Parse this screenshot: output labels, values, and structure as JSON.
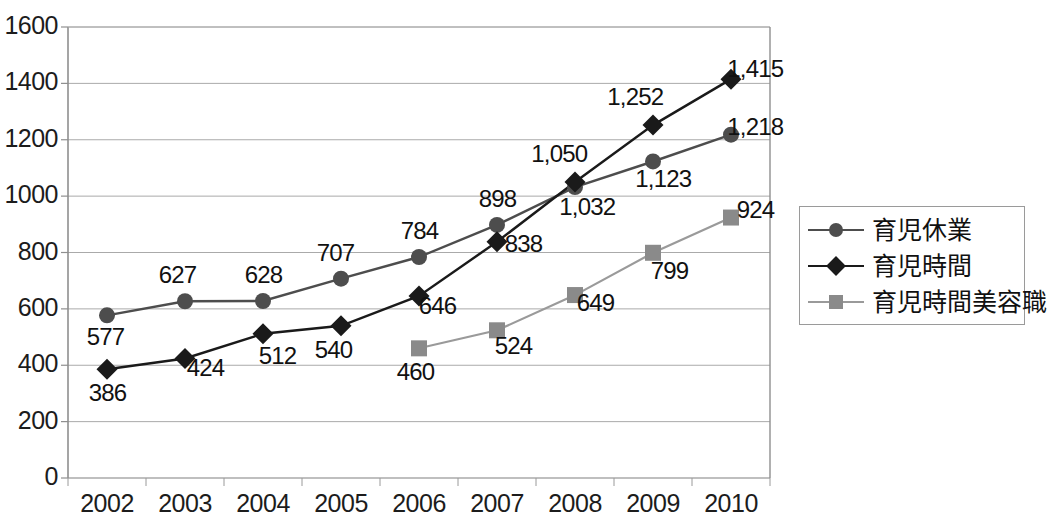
{
  "chart_data": {
    "type": "line",
    "title": "",
    "xlabel": "",
    "ylabel": "",
    "categories": [
      "2002",
      "2003",
      "2004",
      "2005",
      "2006",
      "2007",
      "2008",
      "2009",
      "2010"
    ],
    "ylim": [
      0,
      1600
    ],
    "ytick_step": 200,
    "yticks": [
      "0",
      "200",
      "400",
      "600",
      "800",
      "1000",
      "1200",
      "1400",
      "1600"
    ],
    "grid": true,
    "legend_position": "right",
    "series": [
      {
        "name": "育児休業",
        "marker": "circle",
        "color": "#4d4d4d",
        "line_color": "#4d4d4d",
        "values": [
          577,
          627,
          628,
          707,
          784,
          898,
          1032,
          1123,
          1218
        ],
        "labels": [
          "577",
          "627",
          "628",
          "707",
          "784",
          "898",
          "1,032",
          "1,123",
          "1,218"
        ]
      },
      {
        "name": "育児時間",
        "marker": "diamond",
        "color": "#1a1a1a",
        "line_color": "#1a1a1a",
        "values": [
          386,
          424,
          512,
          540,
          646,
          838,
          1050,
          1252,
          1415
        ],
        "labels": [
          "386",
          "424",
          "512",
          "540",
          "646",
          "838",
          "1,050",
          "1,252",
          "1,415"
        ]
      },
      {
        "name": "育児時間美容職",
        "marker": "square",
        "color": "#8a8a8a",
        "line_color": "#9a9a9a",
        "values": [
          null,
          null,
          null,
          null,
          460,
          524,
          649,
          799,
          924
        ],
        "labels": [
          "",
          "",
          "",
          "",
          "460",
          "524",
          "649",
          "799",
          "924"
        ]
      }
    ]
  },
  "legend": {
    "items": [
      {
        "label": "育児休業"
      },
      {
        "label": "育児時間"
      },
      {
        "label": "育児時間美容職"
      }
    ]
  }
}
